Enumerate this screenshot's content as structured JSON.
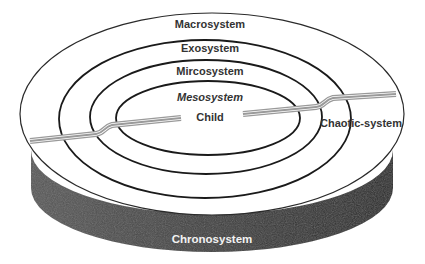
{
  "diagram": {
    "type": "nested-ecological-systems",
    "levels": [
      {
        "id": "macrosystem",
        "label": "Macrosystem"
      },
      {
        "id": "exosystem",
        "label": "Exosystem"
      },
      {
        "id": "microsystem",
        "label": "Mircosystem"
      },
      {
        "id": "mesosystem",
        "label": "Mesosystem"
      },
      {
        "id": "child",
        "label": "Child"
      }
    ],
    "crosscut_label": "Chaotic-system",
    "base_label": "Chronosystem",
    "colors": {
      "background": "#ffffff",
      "ring_stroke": "#1a1a1a",
      "cylinder_side": "#3d3d3d",
      "road": "#9a9a9a",
      "text": "#333333",
      "base_text": "#f2f2f2"
    }
  }
}
